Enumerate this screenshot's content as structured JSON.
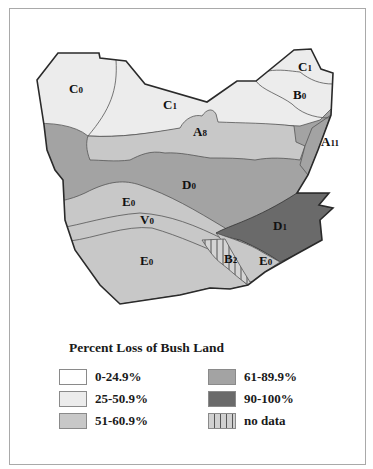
{
  "map": {
    "title": "Percent Loss of Bush Land",
    "colors": {
      "class_0_24_9": "#ffffff",
      "class_25_50_9": "#ececec",
      "class_51_60_9": "#c8c8c8",
      "class_61_89_9": "#a3a3a3",
      "class_90_100": "#6a6a6a",
      "no_data": "#cfcfcf",
      "outline": "#2a2a2a",
      "inner_border": "#555555"
    },
    "regions": [
      {
        "id": "C0",
        "main": "C",
        "sub": "0",
        "class": "25-50.9%"
      },
      {
        "id": "C1-west",
        "main": "C",
        "sub": "1",
        "class": "25-50.9%"
      },
      {
        "id": "C1-east",
        "main": "C",
        "sub": "1",
        "class": "25-50.9%"
      },
      {
        "id": "B0",
        "main": "B",
        "sub": "0",
        "class": "25-50.9%"
      },
      {
        "id": "A8",
        "main": "A",
        "sub": "8",
        "class": "51-60.9%"
      },
      {
        "id": "A11",
        "main": "A",
        "sub": "11",
        "class": "61-89.9%"
      },
      {
        "id": "D0",
        "main": "D",
        "sub": "0",
        "class": "61-89.9%"
      },
      {
        "id": "D1",
        "main": "D",
        "sub": "1",
        "class": "90-100%"
      },
      {
        "id": "E0-north",
        "main": "E",
        "sub": "0",
        "class": "51-60.9%"
      },
      {
        "id": "V0",
        "main": "V",
        "sub": "0",
        "class": "51-60.9%"
      },
      {
        "id": "E0-south",
        "main": "E",
        "sub": "0",
        "class": "51-60.9%"
      },
      {
        "id": "B2",
        "main": "B",
        "sub": "2",
        "class": "no data"
      },
      {
        "id": "E0-east",
        "main": "E",
        "sub": "0",
        "class": "51-60.9%"
      }
    ]
  },
  "legend": {
    "title": "Percent Loss of Bush Land",
    "items": [
      {
        "label": "0-24.9%",
        "color": "#ffffff",
        "pattern": "solid"
      },
      {
        "label": "25-50.9%",
        "color": "#ececec",
        "pattern": "solid"
      },
      {
        "label": "51-60.9%",
        "color": "#c8c8c8",
        "pattern": "solid"
      },
      {
        "label": "61-89.9%",
        "color": "#a3a3a3",
        "pattern": "solid"
      },
      {
        "label": "90-100%",
        "color": "#6a6a6a",
        "pattern": "solid"
      },
      {
        "label": "no data",
        "color": "#cfcfcf",
        "pattern": "vertical-hatch"
      }
    ]
  }
}
